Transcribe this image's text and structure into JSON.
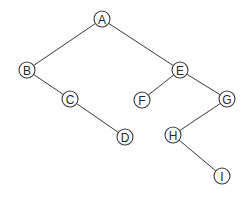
{
  "diagram": {
    "type": "binary-tree",
    "node_radius": 8,
    "colors": {
      "stroke": "#3a3a3a",
      "fill": "#ffffff",
      "text": "#2a2a2a"
    },
    "nodes": [
      {
        "id": "A",
        "label": "A",
        "x": 102,
        "y": 19
      },
      {
        "id": "B",
        "label": "B",
        "x": 27,
        "y": 70
      },
      {
        "id": "C",
        "label": "C",
        "x": 70,
        "y": 99
      },
      {
        "id": "D",
        "label": "D",
        "x": 125,
        "y": 137
      },
      {
        "id": "E",
        "label": "E",
        "x": 180,
        "y": 70
      },
      {
        "id": "F",
        "label": "F",
        "x": 142,
        "y": 100
      },
      {
        "id": "G",
        "label": "G",
        "x": 227,
        "y": 99
      },
      {
        "id": "H",
        "label": "H",
        "x": 173,
        "y": 135
      },
      {
        "id": "I",
        "label": "I",
        "x": 222,
        "y": 176
      }
    ],
    "edges": [
      {
        "from": "A",
        "to": "B"
      },
      {
        "from": "A",
        "to": "E"
      },
      {
        "from": "B",
        "to": "C"
      },
      {
        "from": "C",
        "to": "D"
      },
      {
        "from": "E",
        "to": "F"
      },
      {
        "from": "E",
        "to": "G"
      },
      {
        "from": "G",
        "to": "H"
      },
      {
        "from": "H",
        "to": "I"
      }
    ]
  }
}
